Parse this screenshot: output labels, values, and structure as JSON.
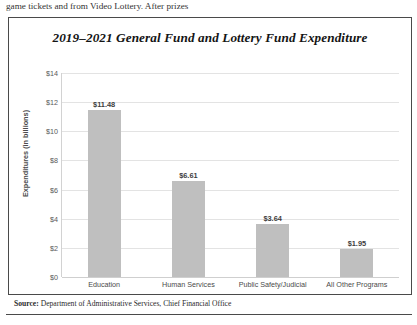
{
  "page": {
    "body_text_above": "game tickets and from Video Lottery. After prizes",
    "source_prefix": "Source:",
    "source_text": " Department of Administrative Services, Chief Financial Office"
  },
  "chart_data": {
    "type": "bar",
    "title": "2019–2021 General Fund and Lottery Fund Expenditure",
    "xlabel": "",
    "ylabel": "Expenditures (in billions)",
    "categories": [
      "Education",
      "Human Services",
      "Public Safety/Judicial",
      "All Other Programs"
    ],
    "values": [
      11.48,
      6.61,
      3.64,
      1.95
    ],
    "data_labels": [
      "$11.48",
      "$6.61",
      "$3.64",
      "$1.95"
    ],
    "ylim": [
      0,
      14
    ],
    "ytick_step": 2,
    "ytick_labels": [
      "$14",
      "$12",
      "$10",
      "$8",
      "$6",
      "$4",
      "$2",
      "$0"
    ],
    "ytick_values": [
      14,
      12,
      10,
      8,
      6,
      4,
      2,
      0
    ],
    "grid": true,
    "legend": false,
    "bar_color": "#bfbfbf",
    "grid_color": "#e3e3e3"
  }
}
